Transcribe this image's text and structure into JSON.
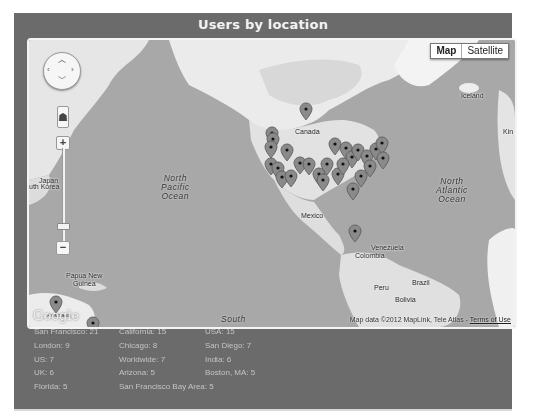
{
  "panel": {
    "title": "Users by location"
  },
  "map": {
    "map_type_buttons": [
      {
        "label": "Map",
        "active": true
      },
      {
        "label": "Satellite",
        "active": false
      }
    ],
    "controls": {
      "pan_icons": [
        "chevron-up-icon",
        "chevron-left-icon",
        "chevron-right-icon",
        "chevron-down-icon"
      ],
      "pegman_icon": "person-icon",
      "zoom_in": "+",
      "zoom_out": "−"
    },
    "labels": {
      "canada": "Canada",
      "iceland": "Iceland",
      "kin": "Kin",
      "japan": "Japan",
      "south_korea": "uth Korea",
      "mexico": "Mexico",
      "venezuela": "Venezuela",
      "colombia": "Colombia",
      "peru": "Peru",
      "brazil": "Brazil",
      "bolivia": "Bolivia",
      "papua_new_guinea_1": "Papua New",
      "papua_new_guinea_2": "Guinea",
      "australia": "Australia",
      "south": "South"
    },
    "oceans": {
      "north_pacific": [
        "North",
        "Pacific",
        "Ocean"
      ],
      "north_atlantic": [
        "North",
        "Atlantic",
        "Ocean"
      ]
    },
    "google_logo": "Google",
    "attribution": "Map data ©2012 MapLink, Tele Atlas - ",
    "terms_link": "Terms of Use"
  },
  "stats": [
    {
      "label": "San Francisco: 21"
    },
    {
      "label": "California: 15"
    },
    {
      "label": "USA: 15"
    },
    {
      "label": "London: 9"
    },
    {
      "label": "Chicago: 8"
    },
    {
      "label": "San Diego: 7"
    },
    {
      "label": "US: 7"
    },
    {
      "label": "Worldwide: 7"
    },
    {
      "label": "India: 6"
    },
    {
      "label": "UK: 6"
    },
    {
      "label": "Arizona: 5"
    },
    {
      "label": "Boston, MA: 5"
    },
    {
      "label": "Florida: 5"
    },
    {
      "label": "San Francisco Bay Area: 5"
    }
  ]
}
